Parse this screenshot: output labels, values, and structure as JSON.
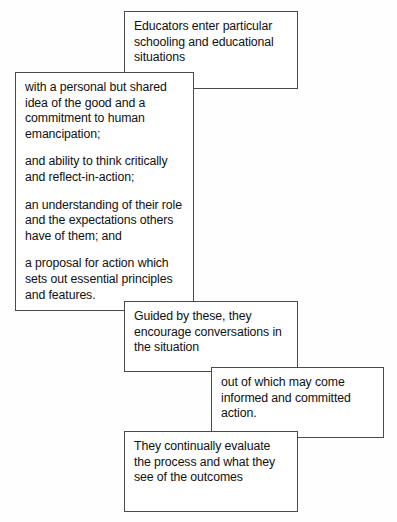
{
  "diagram": {
    "background_color": "#fefefe",
    "border_color": "#4a4a4a",
    "text_color": "#111111",
    "boxes": [
      {
        "id": "entry",
        "name": "entry-box",
        "paragraphs": [
          "Educators enter particular schooling and educational situations"
        ]
      },
      {
        "id": "qualities",
        "name": "qualities-box",
        "paragraphs": [
          "with a personal but shared idea of the good and a commitment to human emancipation;",
          "and ability to think critically and reflect-in-action;",
          "an understanding of their role and the expectations others have of them; and",
          "a proposal for action which sets out essential principles and features."
        ]
      },
      {
        "id": "guided",
        "name": "guided-box",
        "paragraphs": [
          "Guided by these, they encourage conversations in the situation"
        ]
      },
      {
        "id": "outcome",
        "name": "outcome-box",
        "paragraphs": [
          "out of which may come informed and committed action."
        ]
      },
      {
        "id": "evaluate",
        "name": "evaluate-box",
        "paragraphs": [
          "They continually evaluate the process and what they see of the outcomes"
        ]
      }
    ]
  }
}
